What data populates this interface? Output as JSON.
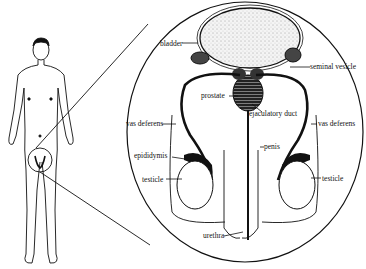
{
  "diagram": {
    "type": "anatomical illustration",
    "figure": {
      "description": "standing male figure with magnified pelvic region"
    },
    "labels": {
      "bladder": "bladder",
      "seminal_vesicle": "seminal vesicle",
      "prostate": "prostate",
      "ejaculatory_duct": "ejaculatory duct",
      "vas_deferens_left": "vas deferens",
      "vas_deferens_right": "vas deferens",
      "epididymis": "epididymis",
      "penis": "penis",
      "testicle_left": "testicle",
      "testicle_right": "testicle",
      "urethra": "urethra"
    }
  }
}
